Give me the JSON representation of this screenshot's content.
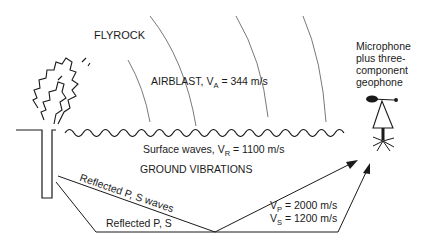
{
  "labels": {
    "flyrock": "FLYROCK",
    "airblast_prefix": "AIRBLAST, V",
    "airblast_sub": "A",
    "airblast_value": " = 344 m/s",
    "surface_prefix": "Surface waves, V",
    "surface_sub": "R",
    "surface_value": " = 1100 m/s",
    "ground": "GROUND VIBRATIONS",
    "reflected_waves": "Reflected P, S waves",
    "reflected_ps": "Reflected P, S",
    "vp_prefix": "V",
    "vp_sub": "P",
    "vp_value": " = 2000 m/s",
    "vs_prefix": "V",
    "vs_sub": "S",
    "vs_value": " = 1200 m/s",
    "sensor_line1": "Microphone",
    "sensor_line2": "plus three-",
    "sensor_line3": "component",
    "sensor_line4": "geophone"
  },
  "colors": {
    "ink": "#1a1a1a",
    "arc": "#555555"
  }
}
